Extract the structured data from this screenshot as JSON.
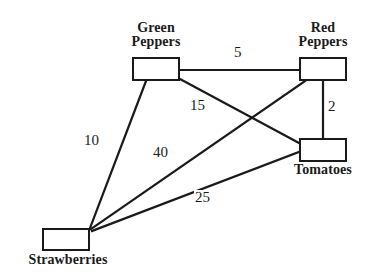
{
  "diagram": {
    "type": "weighted-graph",
    "title": "",
    "background_color": "#ffffff",
    "line_color": "#1a1a1a",
    "text_color": "#1a1a1a",
    "nodes": [
      {
        "id": "green-peppers",
        "label": "Green\nPeppers",
        "label_position": "above",
        "box": {
          "x": 132,
          "y": 57,
          "w": 48,
          "h": 24
        },
        "label_box": {
          "x": 112,
          "y": 21,
          "w": 88,
          "h": 34
        }
      },
      {
        "id": "red-peppers",
        "label": "Red\nPeppers",
        "label_position": "above",
        "box": {
          "x": 299,
          "y": 57,
          "w": 48,
          "h": 24
        },
        "label_box": {
          "x": 279,
          "y": 21,
          "w": 88,
          "h": 34
        }
      },
      {
        "id": "tomatoes",
        "label": "Tomatoes",
        "label_position": "below",
        "box": {
          "x": 299,
          "y": 138,
          "w": 48,
          "h": 24
        },
        "label_box": {
          "x": 279,
          "y": 163,
          "w": 88,
          "h": 18
        }
      },
      {
        "id": "strawberries",
        "label": "Strawberries",
        "label_position": "below",
        "box": {
          "x": 42,
          "y": 228,
          "w": 48,
          "h": 23
        },
        "label_box": {
          "x": 18,
          "y": 253,
          "w": 100,
          "h": 18
        }
      }
    ],
    "edges": [
      {
        "id": "edge-green-red",
        "from": "green-peppers",
        "to": "red-peppers",
        "weight": "5",
        "x1": 180,
        "y1": 70,
        "x2": 299,
        "y2": 70,
        "label_x": 233,
        "label_y": 45
      },
      {
        "id": "edge-green-tomatoes",
        "from": "green-peppers",
        "to": "tomatoes",
        "weight": "15",
        "x1": 180,
        "y1": 79,
        "x2": 299,
        "y2": 143,
        "label_x": 189,
        "label_y": 98
      },
      {
        "id": "edge-red-tomatoes",
        "from": "red-peppers",
        "to": "tomatoes",
        "weight": "2",
        "x1": 323,
        "y1": 81,
        "x2": 323,
        "y2": 138,
        "label_x": 327,
        "label_y": 99
      },
      {
        "id": "edge-green-strawberries",
        "from": "green-peppers",
        "to": "strawberries",
        "weight": "10",
        "x1": 146,
        "y1": 81,
        "x2": 90,
        "y2": 228,
        "label_x": 83,
        "label_y": 133
      },
      {
        "id": "edge-red-strawberries",
        "from": "red-peppers",
        "to": "strawberries",
        "weight": "40",
        "x1": 305,
        "y1": 81,
        "x2": 91,
        "y2": 229,
        "label_x": 152,
        "label_y": 145
      },
      {
        "id": "edge-tomatoes-strawberries",
        "from": "tomatoes",
        "to": "strawberries",
        "weight": "25",
        "x1": 299,
        "y1": 152,
        "x2": 92,
        "y2": 231,
        "label_x": 194,
        "label_y": 190
      }
    ]
  }
}
